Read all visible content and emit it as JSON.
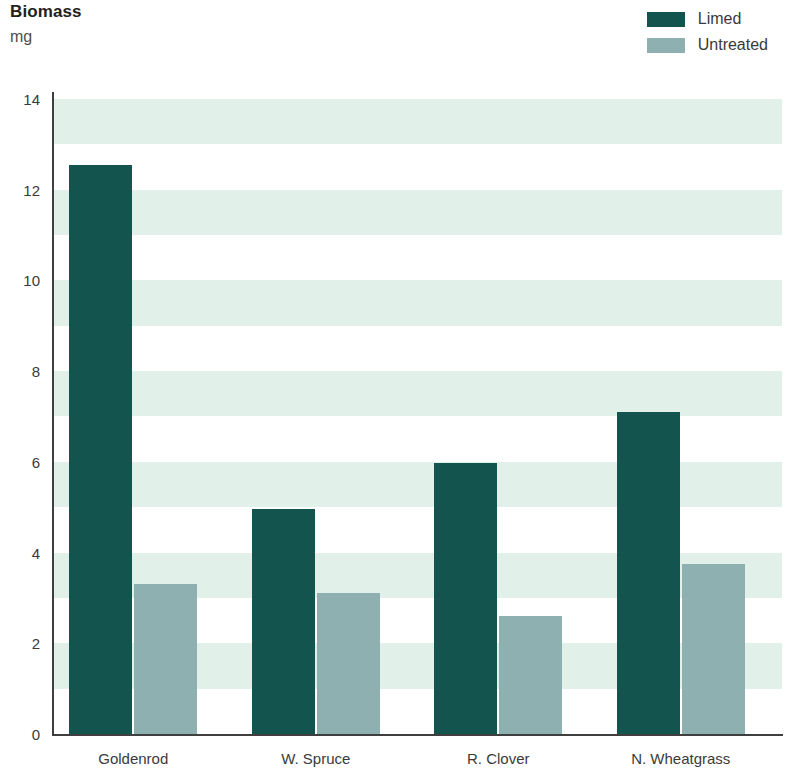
{
  "header": {
    "title": "Biomass",
    "subtitle": "mg"
  },
  "legend": {
    "position": "top-right",
    "entries": [
      {
        "label": "Limed",
        "color": "#14544f"
      },
      {
        "label": "Untreated",
        "color": "#8fb0b0"
      }
    ]
  },
  "colors": {
    "limed": "#14544f",
    "untreated": "#8fb0b0",
    "band": "#e2f0ea",
    "axis": "#3f3f3f",
    "text": "#3a3a3a",
    "title": "#231f20"
  },
  "chart_data": {
    "type": "bar",
    "title": "Biomass",
    "subtitle": "mg",
    "xlabel": "",
    "ylabel": "mg",
    "ylim": [
      0,
      14
    ],
    "ytick_step": 2,
    "ytick_labels": [
      "0",
      "2",
      "4",
      "6",
      "8",
      "10",
      "12",
      "14"
    ],
    "grid": "alternating-horizontal-bands",
    "legend_position": "top-right",
    "categories": [
      "Goldenrod",
      "W. Spruce",
      "R. Clover",
      "N. Wheatgrass"
    ],
    "series": [
      {
        "name": "Limed",
        "color": "#14544f",
        "values": [
          12.55,
          4.95,
          5.98,
          7.1
        ]
      },
      {
        "name": "Untreated",
        "color": "#8fb0b0",
        "values": [
          3.3,
          3.1,
          2.6,
          3.75
        ]
      }
    ]
  }
}
